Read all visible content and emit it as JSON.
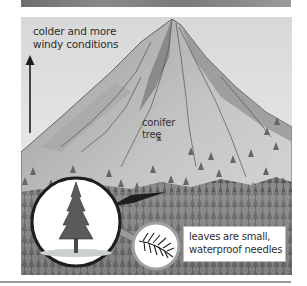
{
  "figure": {
    "top_strip": {
      "description": "cropped edge of previous illustration"
    },
    "annotations": {
      "altitude_label_line1": "colder and more",
      "altitude_label_line2": "windy conditions",
      "tree_label_line1": "conifer",
      "tree_label_line2": "tree",
      "needle_label_line1": "leaves are small,",
      "needle_label_line2": "waterproof needles"
    },
    "icons": {
      "up_arrow": "up-arrow-icon",
      "conifer_tree": "conifer-tree-icon",
      "needle_leaf": "needle-leaf-icon"
    },
    "colors": {
      "sky": "#e6e6e6",
      "mountain_light": "#c9c9c9",
      "mountain_dark": "#8c8c8c",
      "forest": "#7a7a7a",
      "outline": "#1e1e1e",
      "text": "#2e2e2e"
    }
  }
}
